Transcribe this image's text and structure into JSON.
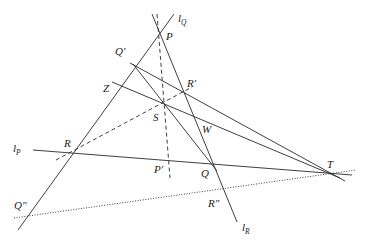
{
  "diagram": {
    "type": "projective-geometry-construction",
    "stroke_color": "#2a2a2a",
    "background": "#ffffff",
    "points": {
      "P": "P",
      "Q": "Q",
      "R": "R",
      "S": "S",
      "T": "T",
      "W": "W",
      "Z": "Z",
      "P_prime": "P′",
      "Q_prime": "Q′",
      "R_prime": "R′",
      "Q_double_prime": "Q″",
      "R_double_prime": "R″"
    },
    "lines": {
      "l_P": {
        "main": "l",
        "sub": "P"
      },
      "l_Q": {
        "main": "l",
        "sub": "Q"
      },
      "l_R": {
        "main": "l",
        "sub": "R"
      }
    },
    "line_styles": {
      "solid": [
        "l_P",
        "l_Q",
        "l_R",
        "Q′T",
        "ZT",
        "Q′Q"
      ],
      "dashed": [
        "PP′",
        "RR′"
      ],
      "dotted": [
        "Q″T"
      ]
    }
  }
}
